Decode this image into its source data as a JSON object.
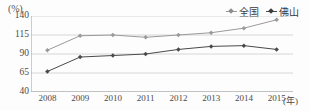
{
  "chart_data": {
    "type": "line",
    "title": "",
    "subtitle": "",
    "xlabel": "(年)",
    "ylabel": "(%)",
    "categories": [
      "2008",
      "2009",
      "2010",
      "2011",
      "2012",
      "2013",
      "2014",
      "2015"
    ],
    "yticks": [
      140,
      115,
      90,
      65,
      40
    ],
    "ylim": [
      40,
      140
    ],
    "grid": true,
    "legend_position": "top-right",
    "series": [
      {
        "name": "全国",
        "color": "#9a9a9a",
        "marker": "diamond",
        "values": [
          95,
          114,
          115,
          112,
          115,
          118,
          124,
          135
        ]
      },
      {
        "name": "佛山",
        "color": "#4a4a4a",
        "marker": "diamond",
        "values": [
          67,
          86,
          88,
          90,
          96,
          100,
          101,
          96
        ]
      }
    ]
  },
  "axes": {
    "unit_label": "(%)",
    "x_unit_label": "(年)"
  },
  "legend": {
    "items": [
      {
        "label": "全国"
      },
      {
        "label": "佛山"
      }
    ]
  },
  "colors": {
    "series_national": "#9a9a9a",
    "series_foshan": "#4a4a4a",
    "gridline": "#d6d6d6",
    "axis": "#9b9b9b",
    "background": "#fdfdfd",
    "text": "#4a4a4a"
  }
}
